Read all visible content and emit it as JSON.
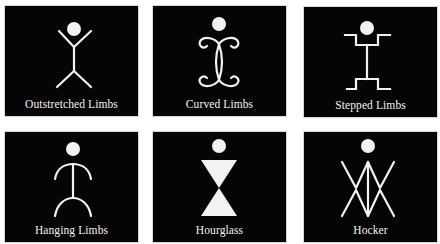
{
  "figure": {
    "panels": [
      {
        "id": "outstretched-limbs",
        "label": "Outstretched Limbs",
        "figure_icon": "stick-figure-outstretched-limbs-icon"
      },
      {
        "id": "curved-limbs",
        "label": "Curved Limbs",
        "figure_icon": "stick-figure-curved-limbs-icon"
      },
      {
        "id": "stepped-limbs",
        "label": "Stepped Limbs",
        "figure_icon": "stick-figure-stepped-limbs-icon"
      },
      {
        "id": "hanging-limbs",
        "label": "Hanging Limbs",
        "figure_icon": "stick-figure-hanging-limbs-icon"
      },
      {
        "id": "hourglass",
        "label": "Hourglass",
        "figure_icon": "hourglass-figure-icon"
      },
      {
        "id": "hocker",
        "label": "Hocker",
        "figure_icon": "hocker-figure-icon"
      }
    ],
    "colors": {
      "panel_background": "#050505",
      "figure": "#f2f2f2",
      "page_background": "#ffffff"
    }
  }
}
